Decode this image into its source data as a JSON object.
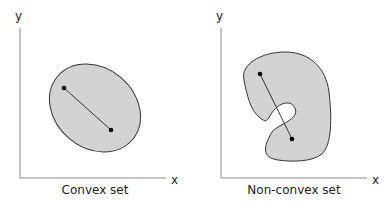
{
  "panels": [
    {
      "caption": "Convex set",
      "x_label": "x",
      "y_label": "y"
    },
    {
      "caption": "Non-convex set",
      "x_label": "x",
      "y_label": "y"
    }
  ],
  "colors": {
    "fill": "#d3d3d3",
    "stroke": "#333333",
    "axis": "#888888"
  }
}
